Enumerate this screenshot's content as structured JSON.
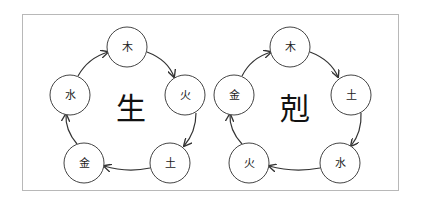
{
  "diagrams": [
    {
      "name": "generating-cycle",
      "center_label": "生",
      "nodes": [
        {
          "label": "木",
          "cx": 127,
          "cy": 47
        },
        {
          "label": "火",
          "cx": 185,
          "cy": 95
        },
        {
          "label": "土",
          "cx": 170,
          "cy": 163
        },
        {
          "label": "金",
          "cx": 84,
          "cy": 163
        },
        {
          "label": "水",
          "cx": 70,
          "cy": 95
        }
      ],
      "order": [
        "木",
        "火",
        "土",
        "金",
        "水"
      ]
    },
    {
      "name": "overcoming-cycle",
      "center_label": "剋",
      "nodes": [
        {
          "label": "木",
          "cx": 290,
          "cy": 47
        },
        {
          "label": "土",
          "cx": 351,
          "cy": 95
        },
        {
          "label": "水",
          "cx": 340,
          "cy": 163
        },
        {
          "label": "火",
          "cx": 249,
          "cy": 163
        },
        {
          "label": "金",
          "cx": 234,
          "cy": 95
        }
      ],
      "order": [
        "木",
        "土",
        "水",
        "火",
        "金"
      ]
    }
  ],
  "colors": {
    "stroke": "#333333",
    "frame": "#b8b8b8",
    "background": "#ffffff"
  }
}
